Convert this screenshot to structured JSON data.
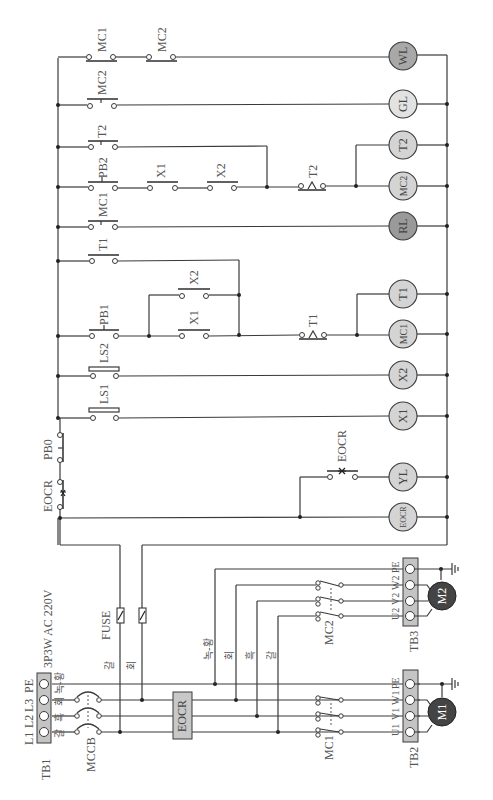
{
  "diagram": {
    "orientation": "rotated-90-ccw",
    "supply": {
      "label": "3P3W AC 220V",
      "terminal_block": "TB1",
      "terminals": [
        "L1",
        "L2",
        "L3",
        "PE"
      ],
      "wire_colors": [
        "갈",
        "흑",
        "회",
        "녹-황"
      ]
    },
    "breaker": {
      "label": "MCCB"
    },
    "overcurrent_relay": {
      "label": "EOCR"
    },
    "fuse": {
      "label": "FUSE",
      "wire_colors": [
        "갈",
        "회"
      ]
    },
    "branch_wire_colors": [
      "녹-황",
      "회",
      "흑",
      "갈"
    ],
    "contactors": [
      {
        "label": "MC1"
      },
      {
        "label": "MC2"
      }
    ],
    "motors": [
      {
        "label": "M1",
        "terminal_block": "TB2",
        "terminals": [
          "U1",
          "V1",
          "W1",
          "PE"
        ]
      },
      {
        "label": "M2",
        "terminal_block": "TB3",
        "terminals": [
          "U2",
          "V2",
          "W2",
          "PE"
        ]
      }
    ],
    "control_contacts": {
      "eocr_nc": "EOCR",
      "pb0": "PB0",
      "ls1": "LS1",
      "ls2": "LS2",
      "pb1": "PB1",
      "x1_a": "X1",
      "x2_a": "X2",
      "t1_a": "T1",
      "t1_timed": "T1",
      "mc1_a": "MC1",
      "pb2": "PB2",
      "x1_b": "X1",
      "x2_b": "X2",
      "t2_a": "T2",
      "t2_timed": "T2",
      "mc2_a": "MC2",
      "mc1_wl": "MC1",
      "mc2_wl": "MC2",
      "eocr_no": "EOCR"
    },
    "loads": [
      {
        "label": "EOCR",
        "fill": "#d4d4d4"
      },
      {
        "label": "YL",
        "fill": "#d4d4d4"
      },
      {
        "label": "X1",
        "fill": "#d4d4d4"
      },
      {
        "label": "X2",
        "fill": "#d4d4d4"
      },
      {
        "label": "MC1",
        "fill": "#d4d4d4"
      },
      {
        "label": "T1",
        "fill": "#d4d4d4"
      },
      {
        "label": "RL",
        "fill": "#9a9a9a"
      },
      {
        "label": "MC2",
        "fill": "#d4d4d4"
      },
      {
        "label": "T2",
        "fill": "#d4d4d4"
      },
      {
        "label": "GL",
        "fill": "#e2e2e2"
      },
      {
        "label": "WL",
        "fill": "#a8a8a8"
      }
    ],
    "colors": {
      "wire": "#3a3a3a",
      "terminal_block": "#c4c4c4",
      "motor": "#444444",
      "text": "#555555"
    }
  }
}
